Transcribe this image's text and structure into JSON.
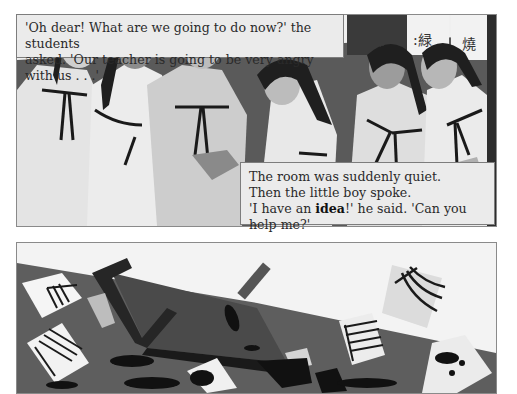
{
  "page": {
    "type": "illustrated story page",
    "color_mode": "grayscale"
  },
  "panels": [
    {
      "id": "top",
      "scene": "six students in white hanbok robes with dark ties standing in a classroom, calligraphy scrolls on the wall",
      "caption": {
        "line1": "'Oh dear! What are we going to do now?' the students",
        "line2": "asked. 'Our teacher is going to be very angry with us . . .'"
      },
      "caption2": {
        "line1": "The room was suddenly quiet.",
        "line2": "Then the little boy spoke.",
        "line3_pre": "'I have an ",
        "line3_bold": "idea",
        "line3_post": "!' he said. 'Can you help me?'"
      }
    },
    {
      "id": "bottom",
      "scene": "overturned desk, spilled ink blots, scattered papers and a book on the floor"
    }
  ],
  "colors": {
    "floor": "#5e5e5e",
    "wall": "#f2f2f2",
    "desk": "#2b2b2b",
    "robe": "#e6e6e6",
    "hair": "#1e1e1e",
    "caption_bg": "#ebebeb",
    "border": "#8a8a8a"
  }
}
